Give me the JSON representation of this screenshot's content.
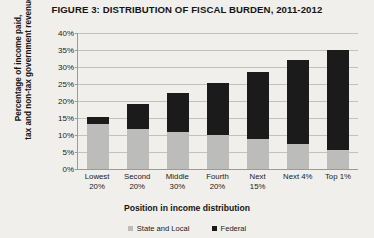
{
  "chart_data": {
    "type": "bar",
    "title": "FIGURE 3: DISTRIBUTION OF FISCAL BURDEN, 2011-2012",
    "xlabel": "Position in income distribution",
    "ylabel_line1": "Percentage of income paid,",
    "ylabel_line2": "tax and non-tax government revenue",
    "categories": [
      "Lowest 20%",
      "Second 20%",
      "Middle 30%",
      "Fourth 20%",
      "Next 15%",
      "Next 4%",
      "Top 1%"
    ],
    "category_lines": [
      [
        "Lowest",
        "20%"
      ],
      [
        "Second",
        "20%"
      ],
      [
        "Middle",
        "30%"
      ],
      [
        "Fourth",
        "20%"
      ],
      [
        "Next",
        "15%"
      ],
      [
        "Next 4%",
        ""
      ],
      [
        "Top 1%",
        ""
      ]
    ],
    "series": [
      {
        "name": "State and Local",
        "color": "#bcbcba",
        "values": [
          13.0,
          11.7,
          10.8,
          9.8,
          8.7,
          7.4,
          5.6
        ]
      },
      {
        "name": "Federal",
        "color": "#1b1b1b",
        "values": [
          2.1,
          7.2,
          11.4,
          15.4,
          19.5,
          24.5,
          29.2
        ]
      }
    ],
    "totals": [
      15.1,
      18.9,
      22.2,
      25.2,
      28.2,
      31.9,
      34.8
    ],
    "stacked": true,
    "ylim": [
      0,
      40
    ],
    "ytick_step": 5,
    "ytick_labels": [
      "0%",
      "5%",
      "10%",
      "15%",
      "20%",
      "25%",
      "30%",
      "35%",
      "40%"
    ],
    "grid": true,
    "legend_position": "bottom"
  }
}
